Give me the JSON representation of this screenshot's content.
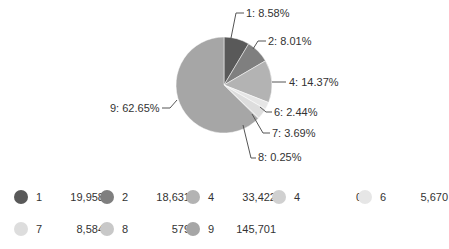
{
  "chart_data": {
    "type": "pie",
    "title": "",
    "categories": [
      "1",
      "2",
      "4",
      "4",
      "6",
      "7",
      "8",
      "9"
    ],
    "values": [
      19958,
      18631,
      33422,
      0,
      5670,
      8584,
      579,
      145701
    ],
    "slice_labels": [
      "1: 8.58%",
      "2: 8.01%",
      "4: 14.37%",
      "",
      "6: 2.44%",
      "7: 3.69%",
      "8: 0.25%",
      "9: 62.65%"
    ],
    "percentages": [
      8.58,
      8.01,
      14.37,
      0,
      2.44,
      3.69,
      0.25,
      62.65
    ],
    "colors": [
      "#595959",
      "#7f7f7f",
      "#b3b3b3",
      "#d0d0d0",
      "#e6e6e6",
      "#dddddd",
      "#c8c8c8",
      "#a6a6a6"
    ],
    "legend_position": "bottom"
  },
  "legend": [
    {
      "name": "1",
      "value": "19,958",
      "color": "#595959"
    },
    {
      "name": "2",
      "value": "18,631",
      "color": "#7f7f7f"
    },
    {
      "name": "4",
      "value": "33,422",
      "color": "#b3b3b3"
    },
    {
      "name": "4",
      "value": "0",
      "color": "#d0d0d0"
    },
    {
      "name": "6",
      "value": "5,670",
      "color": "#e6e6e6"
    },
    {
      "name": "7",
      "value": "8,584",
      "color": "#dddddd"
    },
    {
      "name": "8",
      "value": "579",
      "color": "#c8c8c8"
    },
    {
      "name": "9",
      "value": "145,701",
      "color": "#a6a6a6"
    }
  ]
}
